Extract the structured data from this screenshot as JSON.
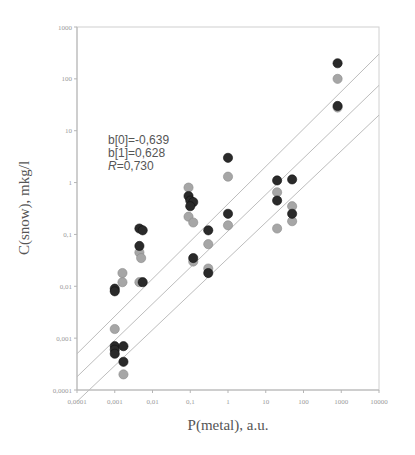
{
  "chart_data": {
    "type": "scatter",
    "title": "",
    "xlabel": "P(metal), a.u.",
    "ylabel": "C(snow), mkg/l",
    "xscale": "log",
    "yscale": "log",
    "xlim": [
      0.0001,
      10000
    ],
    "ylim": [
      0.0001,
      1000
    ],
    "x_ticks": [
      "0,0001",
      "0,001",
      "0,01",
      "0,1",
      "1",
      "10",
      "100",
      "1000",
      "10000"
    ],
    "y_ticks": [
      "0,0001",
      "0,001",
      "0,01",
      "0,1",
      "1",
      "10",
      "100",
      "1000"
    ],
    "grid": false,
    "legend": null,
    "annotation": {
      "lines": [
        "b[0]=-0,639",
        "b[1]=0,628",
        "R=0,730"
      ]
    },
    "regression": {
      "b0": -0.639,
      "b1": 0.628,
      "R": 0.73,
      "lines": [
        {
          "name": "upper",
          "x": [
            0.0001,
            10000
          ],
          "y": [
            0.0005,
            300
          ]
        },
        {
          "name": "fit",
          "x": [
            0.0001,
            10000
          ],
          "y": [
            0.00018,
            75
          ]
        },
        {
          "name": "lower",
          "x": [
            0.0001,
            10000
          ],
          "y": [
            6e-05,
            20
          ]
        }
      ]
    },
    "series": [
      {
        "name": "dark",
        "color": "#2a2a2a",
        "points": [
          [
            0.001,
            0.0007
          ],
          [
            0.001,
            0.0006
          ],
          [
            0.001,
            0.0005
          ],
          [
            0.0017,
            0.0007
          ],
          [
            0.0017,
            0.00035
          ],
          [
            0.001,
            0.009
          ],
          [
            0.001,
            0.008
          ],
          [
            0.0045,
            0.13
          ],
          [
            0.0055,
            0.12
          ],
          [
            0.0045,
            0.06
          ],
          [
            0.0055,
            0.012
          ],
          [
            0.09,
            0.55
          ],
          [
            0.1,
            0.45
          ],
          [
            0.12,
            0.42
          ],
          [
            0.1,
            0.35
          ],
          [
            0.12,
            0.035
          ],
          [
            0.3,
            0.12
          ],
          [
            0.3,
            0.018
          ],
          [
            1.0,
            3.0
          ],
          [
            1.0,
            0.25
          ],
          [
            20,
            1.1
          ],
          [
            20,
            0.45
          ],
          [
            50,
            1.15
          ],
          [
            50,
            0.25
          ],
          [
            800,
            200
          ],
          [
            800,
            30
          ]
        ]
      },
      {
        "name": "light",
        "color": "#a6a6a6",
        "points": [
          [
            0.001,
            0.0015
          ],
          [
            0.0016,
            0.018
          ],
          [
            0.0016,
            0.012
          ],
          [
            0.0017,
            0.0002
          ],
          [
            0.0045,
            0.045
          ],
          [
            0.005,
            0.035
          ],
          [
            0.0045,
            0.012
          ],
          [
            0.09,
            0.8
          ],
          [
            0.09,
            0.22
          ],
          [
            0.12,
            0.17
          ],
          [
            0.12,
            0.03
          ],
          [
            0.3,
            0.065
          ],
          [
            0.3,
            0.022
          ],
          [
            1.0,
            1.3
          ],
          [
            1.0,
            0.15
          ],
          [
            20,
            0.65
          ],
          [
            20,
            0.13
          ],
          [
            50,
            0.35
          ],
          [
            50,
            0.18
          ],
          [
            800,
            100
          ],
          [
            800,
            28
          ]
        ]
      }
    ]
  }
}
